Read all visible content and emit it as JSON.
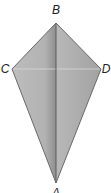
{
  "figure": {
    "type": "kite",
    "vertices": {
      "B": {
        "label": "B",
        "x": 56,
        "y": 23,
        "label_x": 56,
        "label_y": 14
      },
      "C": {
        "label": "C",
        "x": 12,
        "y": 69,
        "label_x": 5,
        "label_y": 73
      },
      "D": {
        "label": "D",
        "x": 101,
        "y": 69,
        "label_x": 106,
        "label_y": 73
      },
      "A": {
        "label": "A",
        "x": 56,
        "y": 183,
        "label_x": 56,
        "label_y": 197
      }
    },
    "diagonals": [
      "BA",
      "CD"
    ],
    "colors": {
      "left_face": "#b4b4b4",
      "left_shadow": "#8e8e8e",
      "right_face": "#a6a6a6",
      "edge": "#6a6a6a",
      "fold_line": "#555555",
      "cd_line": "#d8d8d8"
    }
  }
}
